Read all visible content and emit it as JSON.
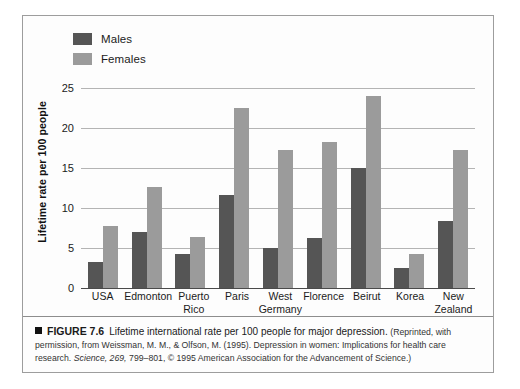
{
  "figure": {
    "marker_icon": "black-square-icon",
    "number_label": "FIGURE 7.6",
    "title_text": "Lifetime international rate per 100 people for major depression.",
    "credit_open": "(Reprinted, with permission, from Weissman, M. M., & Olfson, M. (1995). Depression in women: Implications for health care research.",
    "credit_journal": "Science, 269,",
    "credit_close": "799–801, © 1995 American Association for the Advancement of Science.)"
  },
  "legend": {
    "position": "top-left",
    "items": [
      {
        "label": "Males",
        "color": "#555555",
        "swatch_icon": "legend-swatch-icon"
      },
      {
        "label": "Females",
        "color": "#9b9b9b",
        "swatch_icon": "legend-swatch-icon"
      }
    ]
  },
  "chart_data": {
    "type": "bar",
    "title": "Lifetime international rate per 100 people for major depression",
    "xlabel": "",
    "ylabel": "Lifetime rate per 100 people",
    "ylim": [
      0,
      25
    ],
    "yticks": [
      0,
      5,
      10,
      15,
      20,
      25
    ],
    "ytick_labels": [
      "0",
      "5",
      "10",
      "15",
      "20",
      "25"
    ],
    "grid": "horizontal",
    "legend_position": "top-left",
    "categories": [
      "USA",
      "Edmonton",
      "Puerto\nRico",
      "Paris",
      "West\nGermany",
      "Florence",
      "Beirut",
      "Korea",
      "New\nZealand"
    ],
    "category_lines": [
      [
        "USA",
        ""
      ],
      [
        "Edmonton",
        ""
      ],
      [
        "Puerto",
        "Rico"
      ],
      [
        "Paris",
        ""
      ],
      [
        "West",
        "Germany"
      ],
      [
        "Florence",
        ""
      ],
      [
        "Beirut",
        ""
      ],
      [
        "Korea",
        ""
      ],
      [
        "New",
        "Zealand"
      ]
    ],
    "series": [
      {
        "name": "Males",
        "color": "#555555",
        "values": [
          3.2,
          7.0,
          4.2,
          11.6,
          5.0,
          6.3,
          15.0,
          2.5,
          8.4
        ]
      },
      {
        "name": "Females",
        "color": "#9b9b9b",
        "values": [
          7.8,
          12.6,
          6.4,
          22.5,
          17.2,
          18.3,
          24.0,
          4.3,
          17.3
        ]
      }
    ]
  }
}
